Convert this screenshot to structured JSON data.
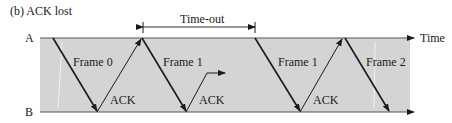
{
  "title": "(b) ACK lost",
  "stations": {
    "top": "A",
    "bottom": "B"
  },
  "axis_label": "Time",
  "timeout_label": "Time-out",
  "labels": {
    "frame0": "Frame 0",
    "ack0": "ACK",
    "frame1": "Frame 1",
    "ack1_lost": "ACK",
    "frame1_retx": "Frame 1",
    "ack1": "ACK",
    "frame2": "Frame 2"
  },
  "colors": {
    "band": "#d4d4d4",
    "line": "#1a1a1a",
    "axis": "#555555"
  }
}
